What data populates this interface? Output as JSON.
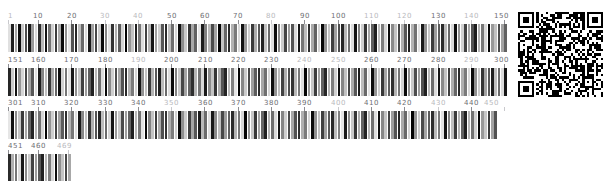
{
  "figure": {
    "type": "barcode-alignment",
    "background": "#ffffff",
    "label_color": "#6e6e73",
    "label_color_minor": "#b9b9bd",
    "bar_color_dark": "#000000",
    "bar_color_light": "#f2f2f2"
  },
  "chart_data": {
    "type": "heatmap",
    "title": "",
    "subtitle": "",
    "xlabel": "",
    "ylabel": "",
    "grid": false,
    "legend": "none",
    "column_width_px": 3.33,
    "columns_per_row": 150,
    "total_columns": 469,
    "value_range": [
      0,
      1
    ],
    "tick_interval": 10,
    "rows": [
      {
        "index": 0,
        "start": 1,
        "end": 150,
        "tick_labels": [
          "1",
          "10",
          "20",
          "30",
          "40",
          "50",
          "60",
          "70",
          "80",
          "90",
          "100",
          "110",
          "120",
          "130",
          "140",
          "150"
        ],
        "major_ticks": [
          "10",
          "20",
          "50",
          "60",
          "70",
          "90",
          "100",
          "130",
          "150"
        ],
        "values": [
          0.12,
          0.88,
          0.35,
          0.95,
          0.22,
          0.7,
          0.91,
          0.4,
          0.15,
          0.82,
          0.28,
          0.93,
          0.55,
          0.18,
          0.76,
          0.33,
          0.97,
          0.44,
          0.1,
          0.68,
          0.85,
          0.26,
          0.59,
          0.14,
          0.9,
          0.37,
          0.72,
          0.2,
          0.96,
          0.48,
          0.11,
          0.8,
          0.31,
          0.64,
          0.17,
          0.99,
          0.42,
          0.24,
          0.87,
          0.53,
          0.13,
          0.74,
          0.29,
          0.92,
          0.38,
          0.19,
          0.66,
          0.83,
          0.25,
          0.57,
          0.16,
          0.94,
          0.45,
          0.21,
          0.78,
          0.34,
          0.62,
          0.1,
          0.89,
          0.5,
          0.27,
          0.71,
          0.36,
          0.98,
          0.23,
          0.6,
          0.84,
          0.3,
          0.52,
          0.15,
          0.93,
          0.41,
          0.18,
          0.77,
          0.32,
          0.65,
          0.86,
          0.24,
          0.58,
          0.12,
          0.95,
          0.47,
          0.2,
          0.73,
          0.39,
          0.67,
          0.14,
          0.91,
          0.54,
          0.26,
          0.81,
          0.33,
          0.61,
          0.17,
          0.97,
          0.43,
          0.22,
          0.75,
          0.37,
          0.69,
          0.85,
          0.28,
          0.56,
          0.13,
          0.92,
          0.49,
          0.19,
          0.79,
          0.35,
          0.63,
          0.88,
          0.25,
          0.51,
          0.16,
          0.96,
          0.46,
          0.23,
          0.72,
          0.31,
          0.66,
          0.87,
          0.29,
          0.55,
          0.11,
          0.9,
          0.44,
          0.21,
          0.76,
          0.38,
          0.64,
          0.83,
          0.27,
          0.59,
          0.14,
          0.94,
          0.42,
          0.18,
          0.74,
          0.34,
          0.68,
          0.89,
          0.3,
          0.53,
          0.15,
          0.98,
          0.4,
          0.24,
          0.7,
          0.36,
          0.62
        ],
        "has_qr": true
      },
      {
        "index": 1,
        "start": 151,
        "end": 300,
        "tick_labels": [
          "151",
          "160",
          "170",
          "180",
          "190",
          "200",
          "210",
          "220",
          "230",
          "240",
          "250",
          "260",
          "270",
          "280",
          "290",
          "300"
        ],
        "major_ticks": [
          "151",
          "160",
          "170",
          "180",
          "200",
          "210",
          "220",
          "230",
          "260",
          "270",
          "280",
          "300"
        ],
        "values": [
          0.85,
          0.2,
          0.93,
          0.41,
          0.16,
          0.72,
          0.37,
          0.66,
          0.12,
          0.89,
          0.48,
          0.25,
          0.78,
          0.33,
          0.6,
          0.95,
          0.18,
          0.54,
          0.11,
          0.91,
          0.44,
          0.22,
          0.75,
          0.39,
          0.63,
          0.87,
          0.28,
          0.57,
          0.14,
          0.97,
          0.46,
          0.19,
          0.7,
          0.35,
          0.68,
          0.84,
          0.31,
          0.52,
          0.17,
          0.92,
          0.43,
          0.24,
          0.77,
          0.3,
          0.65,
          0.88,
          0.26,
          0.58,
          0.13,
          0.96,
          0.49,
          0.21,
          0.73,
          0.36,
          0.61,
          0.82,
          0.29,
          0.55,
          0.15,
          0.9,
          0.45,
          0.23,
          0.79,
          0.32,
          0.67,
          0.86,
          0.27,
          0.5,
          0.1,
          0.99,
          0.47,
          0.2,
          0.71,
          0.38,
          0.64,
          0.83,
          0.34,
          0.56,
          0.16,
          0.94,
          0.42,
          0.25,
          0.74,
          0.31,
          0.69,
          0.8,
          0.28,
          0.53,
          0.12,
          0.98,
          0.4,
          0.22,
          0.76,
          0.37,
          0.62,
          0.85,
          0.3,
          0.51,
          0.18,
          0.93,
          0.48,
          0.24,
          0.72,
          0.33,
          0.66,
          0.89,
          0.26,
          0.59,
          0.11,
          0.95,
          0.41,
          0.19,
          0.78,
          0.35,
          0.63,
          0.81,
          0.29,
          0.54,
          0.17,
          0.97,
          0.44,
          0.21,
          0.7,
          0.39,
          0.68,
          0.87,
          0.27,
          0.57,
          0.13,
          0.91,
          0.46,
          0.23,
          0.75,
          0.32,
          0.6,
          0.84,
          0.31,
          0.52,
          0.15,
          0.96,
          0.43,
          0.2,
          0.79,
          0.36,
          0.65,
          0.88,
          0.25,
          0.58,
          0.14,
          0.92
        ],
        "has_qr": false
      },
      {
        "index": 2,
        "start": 301,
        "end": 450,
        "tick_labels": [
          "301",
          "310",
          "320",
          "330",
          "340",
          "350",
          "360",
          "370",
          "380",
          "390",
          "400",
          "410",
          "420",
          "430",
          "440",
          "450"
        ],
        "major_ticks": [
          "301",
          "310",
          "320",
          "330",
          "340",
          "360",
          "370",
          "380",
          "390",
          "410",
          "420",
          "440"
        ],
        "values": [
          0.1,
          0.94,
          0.45,
          0.22,
          0.77,
          0.34,
          0.61,
          0.86,
          0.29,
          0.56,
          0.16,
          0.99,
          0.42,
          0.19,
          0.73,
          0.37,
          0.64,
          0.82,
          0.3,
          0.53,
          0.12,
          0.9,
          0.47,
          0.24,
          0.79,
          0.31,
          0.67,
          0.85,
          0.26,
          0.59,
          0.17,
          0.93,
          0.4,
          0.21,
          0.71,
          0.38,
          0.62,
          0.88,
          0.28,
          0.55,
          0.11,
          0.97,
          0.49,
          0.23,
          0.76,
          0.33,
          0.69,
          0.8,
          0.32,
          0.51,
          0.18,
          0.95,
          0.44,
          0.2,
          0.74,
          0.35,
          0.66,
          0.89,
          0.27,
          0.58,
          0.13,
          0.91,
          0.46,
          0.25,
          0.72,
          0.39,
          0.63,
          0.83,
          0.3,
          0.54,
          0.15,
          0.98,
          0.41,
          0.22,
          0.78,
          0.36,
          0.6,
          0.87,
          0.29,
          0.57,
          0.14,
          0.92,
          0.48,
          0.19,
          0.7,
          0.34,
          0.68,
          0.81,
          0.31,
          0.52,
          0.16,
          0.96,
          0.43,
          0.24,
          0.75,
          0.37,
          0.65,
          0.84,
          0.26,
          0.5,
          0.1,
          0.9,
          0.45,
          0.21,
          0.79,
          0.32,
          0.61,
          0.86,
          0.28,
          0.56,
          0.12,
          0.94,
          0.47,
          0.23,
          0.73,
          0.38,
          0.67,
          0.85,
          0.33,
          0.59,
          0.17,
          0.99,
          0.42,
          0.2,
          0.71,
          0.35,
          0.64,
          0.82,
          0.27,
          0.53,
          0.11,
          0.93,
          0.49,
          0.25,
          0.77,
          0.3,
          0.62,
          0.88,
          0.29,
          0.55,
          0.18,
          0.97,
          0.4,
          0.22,
          0.76,
          0.36,
          0.68
        ],
        "has_qr": false
      },
      {
        "index": 3,
        "start": 451,
        "end": 469,
        "tick_labels": [
          "451",
          "460",
          "469"
        ],
        "major_ticks": [
          "451",
          "460"
        ],
        "values": [
          0.83,
          0.31,
          0.54,
          0.14,
          0.91,
          0.46,
          0.2,
          0.74,
          0.39,
          0.66,
          0.87,
          0.28,
          0.51,
          0.16,
          0.95,
          0.44,
          0.23,
          0.72,
          0.34
        ],
        "has_qr": false
      }
    ]
  },
  "qr_code": {
    "name": "qr-code",
    "modules": 37,
    "size_px": 85,
    "position": {
      "x": 518,
      "y": 12
    },
    "foreground": "#000000",
    "background": "#ffffff"
  }
}
